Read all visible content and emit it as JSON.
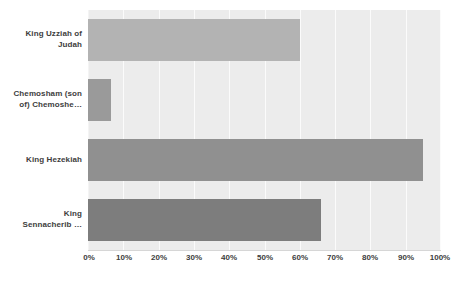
{
  "chart_data": {
    "type": "bar",
    "orientation": "horizontal",
    "title": "",
    "subtitle": "",
    "xlabel": "",
    "ylabel": "",
    "xlim": [
      0,
      100
    ],
    "xtick_labels": [
      "0%",
      "10%",
      "20%",
      "30%",
      "40%",
      "50%",
      "60%",
      "70%",
      "80%",
      "90%",
      "100%"
    ],
    "xtick_values": [
      0,
      10,
      20,
      30,
      40,
      50,
      60,
      70,
      80,
      90,
      100
    ],
    "grid": true,
    "grid_axis": "x",
    "legend": false,
    "legend_position": "none",
    "value_suffix": "%",
    "categories": [
      "King Uzziah of Judah",
      "Chemosham (son of) Chemoshe…",
      "King Hezekiah",
      "King Sennacherib …"
    ],
    "values": [
      60,
      6.5,
      95,
      66
    ],
    "bar_colors": [
      "#b3b3b3",
      "#9a9a9a",
      "#909090",
      "#7d7d7d"
    ],
    "plot_background": "#ececec",
    "gridline_color": "#fbfbfb",
    "axis_line_color": "#d6d6d6",
    "label_color": "#3d3d3d",
    "page_background": "#ffffff"
  },
  "axis": {
    "x_ticks": [
      {
        "label": "0%",
        "value": 0
      },
      {
        "label": "10%",
        "value": 10
      },
      {
        "label": "20%",
        "value": 20
      },
      {
        "label": "30%",
        "value": 30
      },
      {
        "label": "40%",
        "value": 40
      },
      {
        "label": "50%",
        "value": 50
      },
      {
        "label": "60%",
        "value": 60
      },
      {
        "label": "70%",
        "value": 70
      },
      {
        "label": "80%",
        "value": 80
      },
      {
        "label": "90%",
        "value": 90
      },
      {
        "label": "100%",
        "value": 100
      }
    ]
  },
  "bars": [
    {
      "label": "King Uzziah of Judah",
      "label_line1": "King Uzziah of",
      "label_line2": "Judah",
      "value": 60,
      "color": "#b3b3b3"
    },
    {
      "label": "Chemosham (son of) Chemoshe…",
      "label_line1": "Chemosham (son",
      "label_line2": "of) Chemoshe…",
      "value": 6.5,
      "color": "#9a9a9a"
    },
    {
      "label": "King Hezekiah",
      "label_line1": "King Hezekiah",
      "label_line2": "",
      "value": 95,
      "color": "#909090"
    },
    {
      "label": "King Sennacherib …",
      "label_line1": "King",
      "label_line2": "Sennacherib …",
      "value": 66,
      "color": "#7d7d7d"
    }
  ]
}
